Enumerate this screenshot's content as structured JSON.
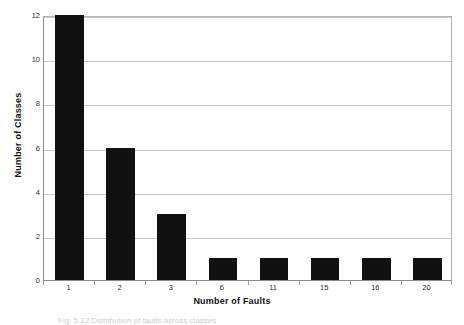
{
  "figure": {
    "caption_partial": "Fig. 5.12  Distribution of faults across classes"
  },
  "chart_data": {
    "type": "bar",
    "title": "",
    "subtitle": "",
    "xlabel": "Number of Faults",
    "ylabel": "Number of Classes",
    "categories": [
      "1",
      "2",
      "3",
      "6",
      "11",
      "15",
      "16",
      "20"
    ],
    "values": [
      12,
      6,
      3,
      1,
      1,
      1,
      1,
      1
    ],
    "series": [
      {
        "name": "Classes",
        "values": [
          12,
          6,
          3,
          1,
          1,
          1,
          1,
          1
        ]
      }
    ],
    "ylim": [
      0,
      12
    ],
    "yticks": [
      0,
      2,
      4,
      6,
      8,
      10,
      12
    ],
    "ytick_labels": [
      "0",
      "2",
      "4",
      "6",
      "8",
      "10",
      "12"
    ],
    "grid": true,
    "grid_axis": "y",
    "legend": false,
    "legend_position": "none",
    "bar_color": "#111111",
    "grid_color": "#c9c9c9",
    "axis_color": "#8c8c8c",
    "background": "#ffffff"
  }
}
